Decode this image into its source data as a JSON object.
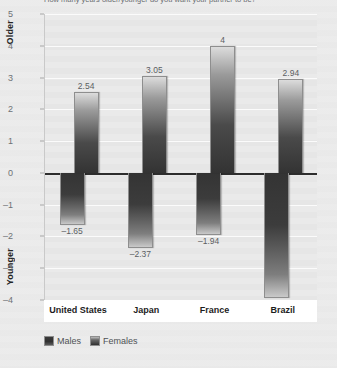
{
  "figure": {
    "title_cropped": "How many years older/younger do you want your partner to be?",
    "background_color": "#ebebeb",
    "plot_background_color": "#e9e9e9",
    "gridline_color": "#fbfbfb",
    "zero_line_color": "#2e2e2e",
    "category_band_color": "#ffffff"
  },
  "axis": {
    "top_end_label": "Older",
    "bottom_end_label": "Younger",
    "ticks": [
      {
        "label": "5",
        "value": 5
      },
      {
        "label": "4",
        "value": 4
      },
      {
        "label": "3",
        "value": 3
      },
      {
        "label": "2",
        "value": 2
      },
      {
        "label": "1",
        "value": 1
      },
      {
        "label": "0",
        "value": 0
      },
      {
        "label": "-1",
        "value": -1
      },
      {
        "label": "-2",
        "value": -2
      },
      {
        "label": "-3",
        "value": -3
      },
      {
        "label": "-4",
        "value": -4
      }
    ]
  },
  "legend": {
    "items": [
      {
        "label": "Males",
        "swatch": "males"
      },
      {
        "label": "Females",
        "swatch": "females"
      }
    ]
  },
  "chart_data": {
    "type": "bar",
    "title": "How many years older/younger do you want your partner to be?",
    "xlabel": "",
    "ylabel": "",
    "ylim": [
      -4,
      5
    ],
    "grid": true,
    "legend_position": "bottom-left",
    "axis_annotations": {
      "top": "Older",
      "bottom": "Younger"
    },
    "categories": [
      "United States",
      "Japan",
      "France",
      "Brazil"
    ],
    "series": [
      {
        "name": "Males",
        "values": [
          -1.65,
          -2.37,
          -1.94,
          -3.94
        ],
        "labels": [
          "-1.65",
          "-2.37",
          "-1.94",
          "-3.94"
        ]
      },
      {
        "name": "Females",
        "values": [
          2.54,
          3.05,
          4,
          2.94
        ],
        "labels": [
          "2.54",
          "3.05",
          "4",
          "2.94"
        ]
      }
    ]
  }
}
